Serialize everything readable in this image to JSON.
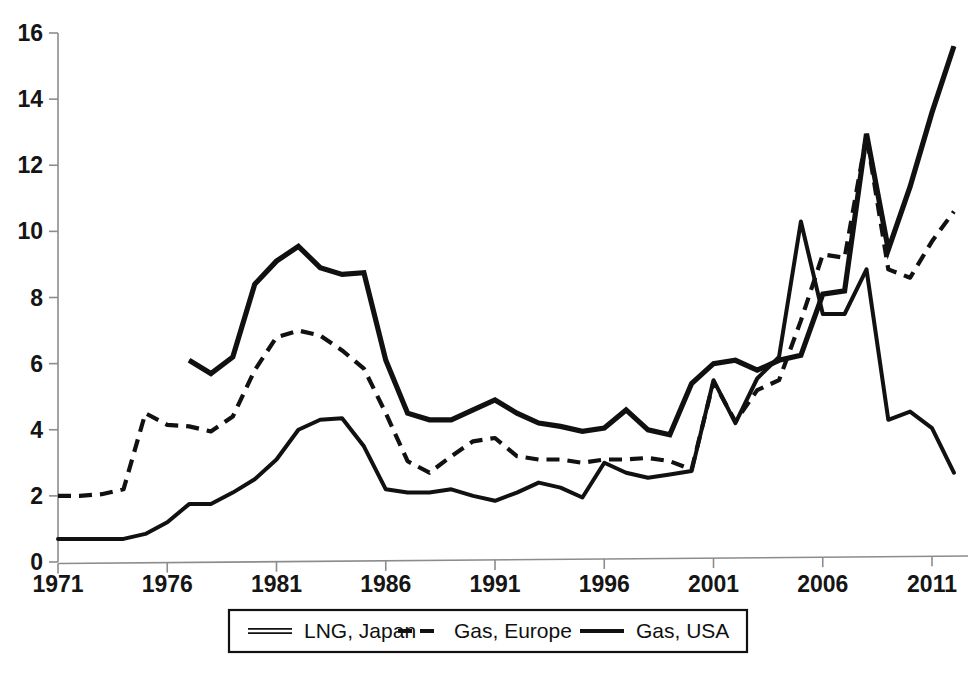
{
  "chart_data": {
    "type": "line",
    "title": "",
    "subtitle": "",
    "xlabel": "",
    "ylabel": "",
    "xlim": [
      1971,
      2012
    ],
    "ylim": [
      0,
      16
    ],
    "y_ticks": [
      0,
      2,
      4,
      6,
      8,
      10,
      12,
      14,
      16
    ],
    "x_ticks": [
      1971,
      1976,
      1981,
      1986,
      1991,
      1996,
      2001,
      2006,
      2011
    ],
    "x_tick_labels": [
      "1971",
      "1976",
      "1981",
      "1986",
      "1991",
      "1996",
      "2001",
      "2006",
      "2011"
    ],
    "y_tick_labels": [
      "0",
      "2",
      "4",
      "6",
      "8",
      "10",
      "12",
      "14",
      "16"
    ],
    "grid": false,
    "legend_position": "bottom",
    "x": [
      1971,
      1972,
      1973,
      1974,
      1975,
      1976,
      1977,
      1978,
      1979,
      1980,
      1981,
      1982,
      1983,
      1984,
      1985,
      1986,
      1987,
      1988,
      1989,
      1990,
      1991,
      1992,
      1993,
      1994,
      1995,
      1996,
      1997,
      1998,
      1999,
      2000,
      2001,
      2002,
      2003,
      2004,
      2005,
      2006,
      2007,
      2008,
      2009,
      2010,
      2011,
      2012
    ],
    "series": [
      {
        "name": "LNG, Japan",
        "style": "double-thin-solid",
        "x_start": 1977,
        "values": [
          null,
          null,
          null,
          null,
          null,
          null,
          6.1,
          5.7,
          6.2,
          8.4,
          9.1,
          9.55,
          8.9,
          8.7,
          8.75,
          6.1,
          4.5,
          4.3,
          4.3,
          4.6,
          4.9,
          4.5,
          4.2,
          4.1,
          3.95,
          4.05,
          4.6,
          4.0,
          3.85,
          5.4,
          6.0,
          6.1,
          5.8,
          6.1,
          6.25,
          8.1,
          8.2,
          12.95,
          9.45,
          11.35,
          13.6,
          15.6
        ]
      },
      {
        "name": "Gas, Europe",
        "style": "dashed",
        "x_start": 1971,
        "values": [
          2.0,
          2.0,
          2.05,
          2.2,
          4.5,
          4.15,
          4.1,
          3.95,
          4.4,
          5.8,
          6.8,
          7.0,
          6.85,
          6.4,
          5.85,
          4.5,
          3.05,
          2.7,
          3.2,
          3.65,
          3.75,
          3.2,
          3.1,
          3.1,
          3.0,
          3.1,
          3.1,
          3.15,
          3.05,
          2.8,
          5.45,
          4.25,
          5.2,
          5.5,
          7.3,
          9.3,
          9.2,
          12.9,
          8.85,
          8.6,
          9.7,
          10.6
        ]
      },
      {
        "name": "Gas, USA",
        "style": "solid",
        "x_start": 1971,
        "values": [
          0.7,
          0.7,
          0.7,
          0.7,
          0.85,
          1.2,
          1.75,
          1.75,
          2.1,
          2.5,
          3.1,
          4.0,
          4.3,
          4.35,
          3.5,
          2.2,
          2.1,
          2.1,
          2.2,
          2.0,
          1.85,
          2.1,
          2.4,
          2.25,
          1.95,
          3.0,
          2.7,
          2.55,
          2.65,
          2.75,
          5.5,
          4.2,
          5.55,
          6.2,
          10.3,
          7.5,
          7.5,
          8.85,
          4.3,
          4.55,
          4.05,
          2.7
        ]
      }
    ],
    "legend": [
      {
        "label": "LNG, Japan",
        "style": "double-thin-solid"
      },
      {
        "label": "Gas, Europe",
        "style": "dashed"
      },
      {
        "label": "Gas, USA",
        "style": "solid"
      }
    ],
    "colors": {
      "line": "#111111",
      "axis": "#8c8c8c",
      "text": "#151515",
      "background": "#ffffff"
    }
  }
}
